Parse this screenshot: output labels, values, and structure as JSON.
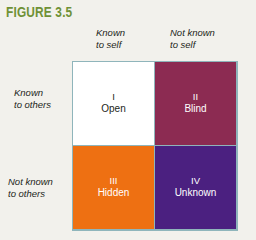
{
  "figure": {
    "title": "FIGURE 3.5",
    "title_color": "#6f9136"
  },
  "axes": {
    "columns": [
      {
        "line1": "Known",
        "line2": "to self"
      },
      {
        "line1": "Not known",
        "line2": "to self"
      }
    ],
    "rows": [
      {
        "line1": "Known",
        "line2": "to others"
      },
      {
        "line1": "Not known",
        "line2": "to others"
      }
    ]
  },
  "matrix": {
    "border_color": "#8fb5bb",
    "quadrants": [
      {
        "numeral": "I",
        "name": "Open",
        "fill": "#ffffff",
        "text_color": "#231f20"
      },
      {
        "numeral": "II",
        "name": "Blind",
        "fill": "#8c2b52",
        "text_color": "#ffffff"
      },
      {
        "numeral": "III",
        "name": "Hidden",
        "fill": "#ee7012",
        "text_color": "#ffffff"
      },
      {
        "numeral": "IV",
        "name": "Unknown",
        "fill": "#4b2080",
        "text_color": "#ffffff"
      }
    ]
  },
  "page": {
    "background": "#f2f1ec"
  }
}
